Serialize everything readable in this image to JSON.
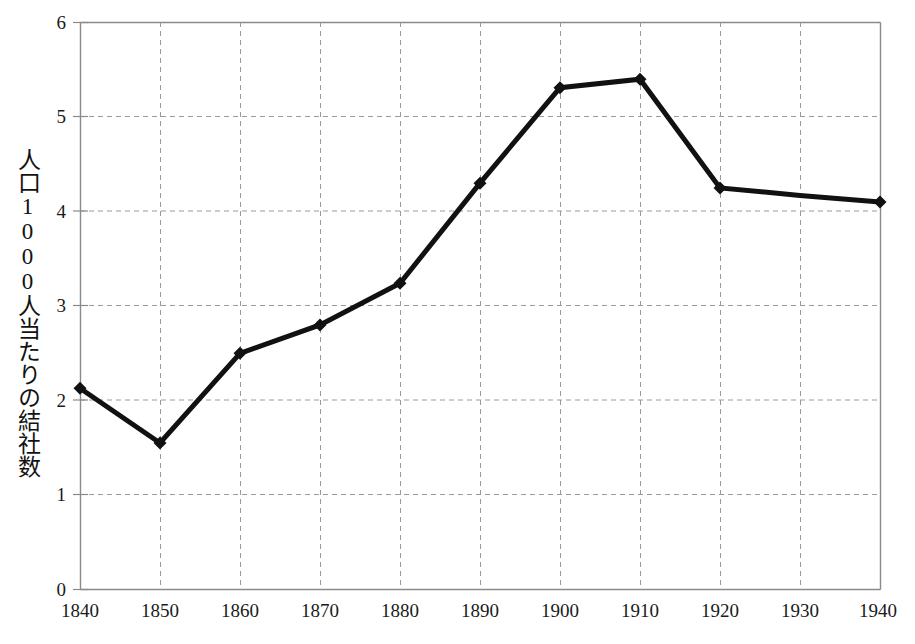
{
  "chart_data": {
    "type": "line",
    "title": "",
    "subtitle": "",
    "xlabel": "",
    "ylabel": "人口1000人当たりの結社数",
    "x": [
      1840,
      1850,
      1860,
      1870,
      1880,
      1890,
      1900,
      1910,
      1920,
      1930,
      1940
    ],
    "values": [
      2.13,
      1.55,
      2.5,
      2.8,
      3.24,
      4.3,
      5.31,
      5.4,
      4.25,
      4.17,
      4.1
    ],
    "markers_at": [
      1840,
      1850,
      1860,
      1870,
      1880,
      1890,
      1900,
      1910,
      1920,
      1940
    ],
    "xlim": [
      1840,
      1940
    ],
    "ylim": [
      0,
      6
    ],
    "xticks": [
      1840,
      1850,
      1860,
      1870,
      1880,
      1890,
      1900,
      1910,
      1920,
      1930,
      1940
    ],
    "yticks": [
      0,
      1,
      2,
      3,
      4,
      5,
      6
    ],
    "xticklabels": [
      "1840",
      "1850",
      "1860",
      "1870",
      "1880",
      "1890",
      "1900",
      "1910",
      "1920",
      "1930",
      "1940"
    ],
    "yticklabels": [
      "0",
      "1",
      "2",
      "3",
      "4",
      "5",
      "6"
    ],
    "grid": "dashed-both",
    "legend": "none",
    "series": [
      {
        "name": "人口1000人当たりの結社数",
        "values": [
          2.13,
          1.55,
          2.5,
          2.8,
          3.24,
          4.3,
          5.31,
          5.4,
          4.25,
          4.17,
          4.1
        ]
      }
    ]
  },
  "style": {
    "line_color": "#111111",
    "marker_color": "#111111",
    "grid_color": "#9a9a9a",
    "axis_color": "#8a8a8a",
    "text_color": "#1a1a1a",
    "background": "#ffffff"
  }
}
